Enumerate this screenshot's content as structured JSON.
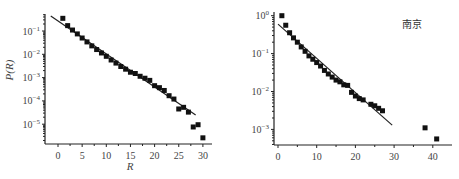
{
  "chart_data": [
    {
      "type": "scatter",
      "title": "",
      "xlabel": "R",
      "ylabel": "P(R)",
      "yscale": "log",
      "xlim": [
        -2.5,
        32.5
      ],
      "ylim": [
        1.5e-06,
        0.6
      ],
      "xticks": [
        0,
        5,
        10,
        15,
        20,
        25,
        30
      ],
      "xtick_labels": [
        "0",
        "5",
        "10",
        "15",
        "20",
        "25",
        "30"
      ],
      "yticks": [
        0.1,
        0.01,
        0.001,
        0.0001,
        1e-05
      ],
      "ytick_labels": [
        {
          "base": "10",
          "exp": "−1"
        },
        {
          "base": "10",
          "exp": "−2"
        },
        {
          "base": "10",
          "exp": "−3"
        },
        {
          "base": "10",
          "exp": "−4"
        },
        {
          "base": "10",
          "exp": "−5"
        }
      ],
      "series": [
        {
          "name": "data",
          "marker": "square",
          "x": [
            1,
            2,
            3,
            4,
            5,
            6,
            7,
            8,
            9,
            10,
            11,
            12,
            13,
            14,
            15,
            16,
            17,
            18,
            19,
            20,
            21,
            22,
            23,
            24,
            25,
            26,
            27,
            28,
            29,
            30
          ],
          "y": [
            0.35,
            0.17,
            0.11,
            0.075,
            0.05,
            0.034,
            0.023,
            0.016,
            0.0114,
            0.0082,
            0.0057,
            0.0042,
            0.003,
            0.0023,
            0.0017,
            0.0015,
            0.00114,
            0.00094,
            0.00076,
            0.00045,
            0.00037,
            0.00028,
            0.000167,
            0.00012,
            4.5e-05,
            5.3e-05,
            3.3e-05,
            7.6e-06,
            9.5e-06,
            2.6e-06
          ]
        },
        {
          "name": "fit",
          "line": true,
          "x": [
            -1.5,
            28.5
          ],
          "y": [
            0.44,
            2.5e-05
          ]
        }
      ],
      "annotation": "",
      "grid": false
    },
    {
      "type": "scatter",
      "title": "",
      "xlabel": "",
      "ylabel": "",
      "yscale": "log",
      "xlim": [
        -1,
        45
      ],
      "ylim": [
        0.00042,
        1.05
      ],
      "xticks": [
        0,
        10,
        20,
        30,
        40
      ],
      "xtick_labels": [
        "0",
        "10",
        "20",
        "30",
        "40"
      ],
      "yticks": [
        1,
        0.1,
        0.01,
        0.001
      ],
      "ytick_labels": [
        {
          "base": "10",
          "exp": "0"
        },
        {
          "base": "10",
          "exp": "−1"
        },
        {
          "base": "10",
          "exp": "−2"
        },
        {
          "base": "10",
          "exp": "−3"
        }
      ],
      "series": [
        {
          "name": "data",
          "marker": "square",
          "x": [
            1,
            2,
            3,
            4,
            5,
            6,
            7,
            8,
            9,
            10,
            11,
            12,
            13,
            14,
            15,
            16,
            17,
            18,
            19,
            20,
            21,
            22,
            24,
            25,
            26,
            27,
            38,
            41
          ],
          "y": [
            1.0,
            0.56,
            0.355,
            0.26,
            0.2,
            0.15,
            0.115,
            0.087,
            0.071,
            0.058,
            0.047,
            0.036,
            0.029,
            0.024,
            0.02,
            0.018,
            0.015,
            0.0145,
            0.0095,
            0.0076,
            0.0065,
            0.006,
            0.0046,
            0.0042,
            0.0036,
            0.0031,
            0.0011,
            0.00056
          ]
        },
        {
          "name": "fit",
          "line": true,
          "x": [
            0,
            29.5
          ],
          "y": [
            0.6,
            0.0013
          ]
        }
      ],
      "annotation": "南京",
      "grid": false
    }
  ]
}
